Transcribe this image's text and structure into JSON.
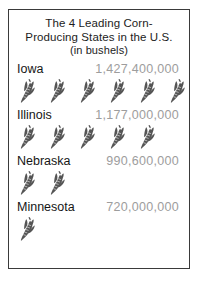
{
  "title": {
    "line1": "The 4 Leading Corn-",
    "line2": "Producing States in the U.S.",
    "line3": "(in bushels)"
  },
  "colors": {
    "frame": "#3a3a3a",
    "state_label": "#161616",
    "value_label": "#9d9d9d",
    "icon_fill": "#555555",
    "background": "#ffffff"
  },
  "icon": {
    "name": "corn-ear-icon",
    "meaning": "ear of corn"
  },
  "chart_data": {
    "type": "bar",
    "xlabel": "",
    "ylabel": "",
    "unit": "bushels",
    "pictograph": true,
    "categories": [
      "Iowa",
      "Illinois",
      "Nebraska",
      "Minnesota"
    ],
    "values": [
      1427400000,
      1177000000,
      990600000,
      720000000
    ],
    "value_labels": [
      "1,427,400,000",
      "1,177,000,000",
      "990,600,000",
      "720,000,000"
    ],
    "icon_counts": [
      6,
      5,
      2,
      1
    ],
    "rows": [
      {
        "state": "Iowa",
        "value": 1427400000,
        "value_label": "1,427,400,000",
        "icons": 6
      },
      {
        "state": "Illinois",
        "value": 1177000000,
        "value_label": "1,177,000,000",
        "icons": 5
      },
      {
        "state": "Nebraska",
        "value": 990600000,
        "value_label": "990,600,000",
        "icons": 2
      },
      {
        "state": "Minnesota",
        "value": 720000000,
        "value_label": "720,000,000",
        "icons": 1
      }
    ]
  }
}
